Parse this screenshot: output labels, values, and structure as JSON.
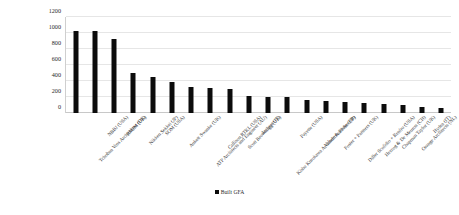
{
  "chart_data": {
    "type": "bar",
    "title": "",
    "xlabel": "",
    "ylabel": "",
    "ylim": [
      0,
      1200
    ],
    "yticks": [
      0,
      200,
      400,
      600,
      800,
      1000,
      1200
    ],
    "grid": true,
    "legend_position": "bottom-center",
    "series_name": "Built GFA",
    "bar_color": "#0c0c0c",
    "gridline_color": "#e6e6e6",
    "categories": [
      "Tchoban Voss Architekten (DE)",
      "NBBJ (USA)",
      "RMJM (UK)",
      "Nikken Sekkei (JP)",
      "SOM (USA)",
      "Aukett Swanke (UK)",
      "ATP Architects and Engineer (AU)",
      "Callison RTKL (USA)",
      "Scott Brownrigg (UK)",
      "Archest (IT)",
      "Kisho Kurokawa Architects and Ass (JP)",
      "Payette (USA)",
      "Valode & Pistre (FR)",
      "Foster + Partners (UK)",
      "Diller Scofidio + Renfro (USA)",
      "Herzog & De Meuron (CH)",
      "Chapman Taylor (UK)",
      "Orange Architects (NL)",
      "Hydea (IT)",
      "Wilmotte et Associés Architectes (FR)"
    ],
    "values": [
      1030,
      1020,
      930,
      500,
      445,
      390,
      320,
      310,
      300,
      210,
      200,
      195,
      165,
      155,
      140,
      125,
      115,
      105,
      80,
      60
    ]
  },
  "legend": {
    "items": [
      {
        "label": "Built GFA",
        "color": "#0c0c0c"
      }
    ]
  }
}
